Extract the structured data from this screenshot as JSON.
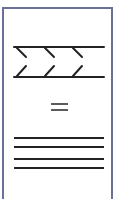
{
  "figure": {
    "label": "Sigma band equals parallel lines",
    "border_color": "#6b6f9a",
    "stroke_color": "#222222",
    "top_symbol": "ΣΣΣ",
    "operator": "=",
    "bottom_symbol": "≡≡"
  }
}
